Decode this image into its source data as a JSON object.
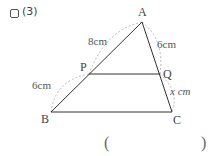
{
  "problem": {
    "number_label": "(3)",
    "answer_open": "(",
    "answer_close": ")"
  },
  "figure": {
    "vertices": {
      "A": {
        "label": "A",
        "x": 142,
        "y": 22
      },
      "P": {
        "label": "P",
        "x": 89,
        "y": 74
      },
      "Q": {
        "label": "Q",
        "x": 160,
        "y": 74
      },
      "B": {
        "label": "B",
        "x": 51,
        "y": 112
      },
      "C": {
        "label": "C",
        "x": 172,
        "y": 112
      }
    },
    "measurements": {
      "AP": "8cm",
      "AQ": "6cm",
      "PB": "6cm",
      "QC": "x cm"
    },
    "colors": {
      "line": "#333333",
      "dashed": "#aaaaaa"
    }
  }
}
